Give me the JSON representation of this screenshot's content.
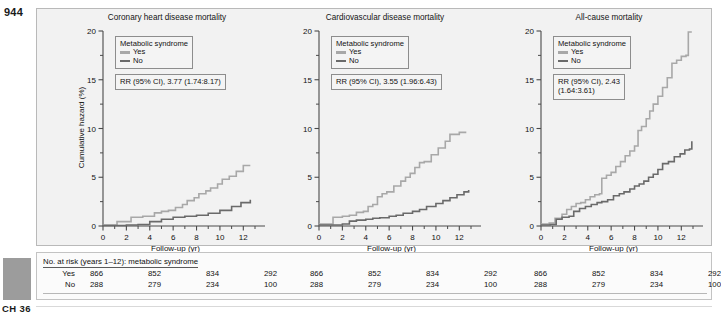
{
  "page": {
    "number": "944",
    "chapter_label": "CH 36",
    "margin_swatch_color": "#9c9c9c"
  },
  "colors": {
    "yes_series": "#a8a8a8",
    "no_series": "#6a6a6a",
    "panel_background": "#f2f2f2",
    "axis": "#4a4a4a"
  },
  "axes": {
    "xlabel": "Follow-up (yr)",
    "ylabel": "Cumulative hazard (%)",
    "xticks": [
      0,
      2,
      4,
      6,
      8,
      10,
      12
    ],
    "yticks": [
      0,
      5,
      10,
      15,
      20
    ],
    "xlim": [
      0,
      13
    ],
    "ylim": [
      0,
      20
    ]
  },
  "legend": {
    "title": "Metabolic syndrome",
    "items": [
      {
        "label": "Yes",
        "color": "#a8a8a8"
      },
      {
        "label": "No",
        "color": "#6a6a6a"
      }
    ]
  },
  "risk_table": {
    "heading": "No. at risk (years 1–12): metabolic syndrome",
    "row_labels": [
      "Yes",
      "No"
    ],
    "values": {
      "yes": [
        866,
        852,
        834,
        292
      ],
      "no": [
        288,
        279,
        234,
        100
      ]
    },
    "panels": 3
  },
  "chart_data": [
    {
      "type": "line",
      "title": "Coronary heart disease mortality",
      "xlabel": "Follow-up (yr)",
      "ylabel": "Cumulative hazard (%)",
      "xlim": [
        0,
        13
      ],
      "ylim": [
        0,
        20
      ],
      "grid": false,
      "legend_position": "top-left",
      "annotation": "RR (95% CI), 3.77 (1.74:8.17)",
      "annotation_lines": [
        "RR (95% CI), 3.77 (1.74:8.17)"
      ],
      "rr": 3.77,
      "ci_low": 1.74,
      "ci_high": 8.17,
      "series": [
        {
          "name": "Yes",
          "color": "#a8a8a8",
          "step": true,
          "x": [
            0,
            0.8,
            1.2,
            2.0,
            2.4,
            3.0,
            3.4,
            4.0,
            4.4,
            5.0,
            5.6,
            6.2,
            6.8,
            7.2,
            7.8,
            8.2,
            8.8,
            9.2,
            9.8,
            10.2,
            10.8,
            11.4,
            12.0,
            12.6
          ],
          "values": [
            0.1,
            0.1,
            0.45,
            0.45,
            0.9,
            0.9,
            1.0,
            1.0,
            1.35,
            1.5,
            1.6,
            1.9,
            2.2,
            2.6,
            2.9,
            3.3,
            3.6,
            3.9,
            4.3,
            4.8,
            5.1,
            5.6,
            6.2,
            6.2
          ]
        },
        {
          "name": "No",
          "color": "#6a6a6a",
          "step": true,
          "x": [
            0,
            1.0,
            2.0,
            3.0,
            4.0,
            5.0,
            6.0,
            7.0,
            8.0,
            9.0,
            10.0,
            11.0,
            11.8,
            12.6
          ],
          "values": [
            0.05,
            0.05,
            0.1,
            0.15,
            0.45,
            0.7,
            0.9,
            1.0,
            1.1,
            1.3,
            1.6,
            2.0,
            2.4,
            2.7
          ]
        }
      ]
    },
    {
      "type": "line",
      "title": "Cardiovascular disease mortality",
      "xlabel": "Follow-up (yr)",
      "ylabel": "Cumulative hazard (%)",
      "xlim": [
        0,
        13
      ],
      "ylim": [
        0,
        20
      ],
      "grid": false,
      "legend_position": "top-left",
      "annotation": "RR (95% CI), 3.55 (1.96:6.43)",
      "annotation_lines": [
        "RR (95% CI), 3.55 (1.96:6.43)"
      ],
      "rr": 3.55,
      "ci_low": 1.96,
      "ci_high": 6.43,
      "series": [
        {
          "name": "Yes",
          "color": "#a8a8a8",
          "step": true,
          "x": [
            0,
            0.8,
            1.2,
            2.0,
            2.6,
            3.2,
            3.8,
            4.2,
            4.6,
            5.0,
            5.4,
            5.8,
            6.4,
            7.0,
            7.4,
            7.8,
            8.2,
            8.6,
            9.0,
            9.6,
            10.2,
            10.8,
            11.2,
            12.0,
            12.6
          ],
          "values": [
            0.2,
            0.2,
            0.9,
            1.0,
            1.1,
            1.4,
            1.5,
            2.0,
            2.2,
            3.0,
            3.3,
            3.5,
            4.1,
            4.6,
            5.0,
            5.4,
            6.0,
            6.5,
            6.6,
            7.3,
            8.0,
            8.7,
            9.4,
            9.6,
            9.6
          ]
        },
        {
          "name": "No",
          "color": "#6a6a6a",
          "step": true,
          "x": [
            0,
            1.0,
            2.0,
            2.6,
            3.2,
            4.0,
            4.6,
            5.2,
            6.0,
            6.6,
            7.2,
            8.0,
            8.6,
            9.2,
            10.0,
            10.6,
            11.2,
            11.8,
            12.4,
            12.8
          ],
          "values": [
            0.1,
            0.1,
            0.2,
            0.5,
            0.6,
            0.7,
            0.8,
            0.85,
            1.0,
            1.1,
            1.3,
            1.5,
            1.7,
            2.0,
            2.3,
            2.6,
            2.9,
            3.2,
            3.5,
            3.7
          ]
        }
      ]
    },
    {
      "type": "line",
      "title": "All-cause mortality",
      "xlabel": "Follow-up (yr)",
      "ylabel": "Cumulative hazard (%)",
      "xlim": [
        0,
        13
      ],
      "ylim": [
        0,
        20
      ],
      "grid": false,
      "legend_position": "top-left",
      "annotation": "RR (95% CI), 2.43 (1.64:3.61)",
      "annotation_lines": [
        "RR (95% CI), 2.43",
        "(1.64:3.61)"
      ],
      "rr": 2.43,
      "ci_low": 1.64,
      "ci_high": 3.61,
      "series": [
        {
          "name": "Yes",
          "color": "#a8a8a8",
          "step": true,
          "x": [
            0,
            0.7,
            1.2,
            1.8,
            2.2,
            2.6,
            3.0,
            3.4,
            3.8,
            4.2,
            4.6,
            5.0,
            5.2,
            5.6,
            6.0,
            6.4,
            6.8,
            7.2,
            7.6,
            8.0,
            8.3,
            8.6,
            9.0,
            9.3,
            9.6,
            10.0,
            10.4,
            10.8,
            11.2,
            11.6,
            12.0,
            12.4,
            12.6,
            12.9
          ],
          "values": [
            0.2,
            0.3,
            0.8,
            1.2,
            1.7,
            2.0,
            2.3,
            2.4,
            2.7,
            3.0,
            3.2,
            3.3,
            4.9,
            5.2,
            5.5,
            6.1,
            6.6,
            7.2,
            7.7,
            8.2,
            9.8,
            10.2,
            11.0,
            11.8,
            12.5,
            13.3,
            14.2,
            15.2,
            16.7,
            17.0,
            17.4,
            17.5,
            19.9,
            19.9
          ]
        },
        {
          "name": "No",
          "color": "#6a6a6a",
          "step": true,
          "x": [
            0,
            0.8,
            1.3,
            1.8,
            2.4,
            2.8,
            3.3,
            3.8,
            4.3,
            4.8,
            5.2,
            5.7,
            6.2,
            6.7,
            7.1,
            7.6,
            8.0,
            8.4,
            8.8,
            9.2,
            9.6,
            10.0,
            10.4,
            10.9,
            11.4,
            11.9,
            12.3,
            12.7,
            12.9
          ],
          "values": [
            0.1,
            0.15,
            0.7,
            0.9,
            1.0,
            1.5,
            1.8,
            2.0,
            2.2,
            2.4,
            2.5,
            2.7,
            3.1,
            3.3,
            3.5,
            3.8,
            4.1,
            4.3,
            4.6,
            5.0,
            5.3,
            5.8,
            6.4,
            6.6,
            7.1,
            7.4,
            7.8,
            7.9,
            8.7
          ]
        }
      ]
    }
  ]
}
